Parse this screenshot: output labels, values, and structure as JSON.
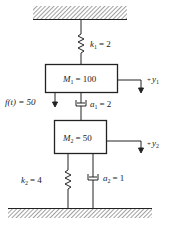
{
  "diagram": {
    "type": "two-mass spring-damper system",
    "spring1": {
      "symbol": "k",
      "sub": "1",
      "value": "= 2"
    },
    "mass1": {
      "symbol": "M",
      "sub": "1",
      "value": "= 100"
    },
    "disp1": {
      "sign": "+",
      "symbol": "y",
      "sub": "1"
    },
    "force": {
      "label": "f(t) = 50"
    },
    "damper1": {
      "symbol": "a",
      "sub": "1",
      "value": "= 2"
    },
    "mass2": {
      "symbol": "M",
      "sub": "2",
      "value": "= 50"
    },
    "disp2": {
      "sign": "+",
      "symbol": "y",
      "sub": "2"
    },
    "spring2": {
      "symbol": "k",
      "sub": "2",
      "value": "= 4"
    },
    "damper2": {
      "symbol": "a",
      "sub": "2",
      "value": "= 1"
    }
  }
}
